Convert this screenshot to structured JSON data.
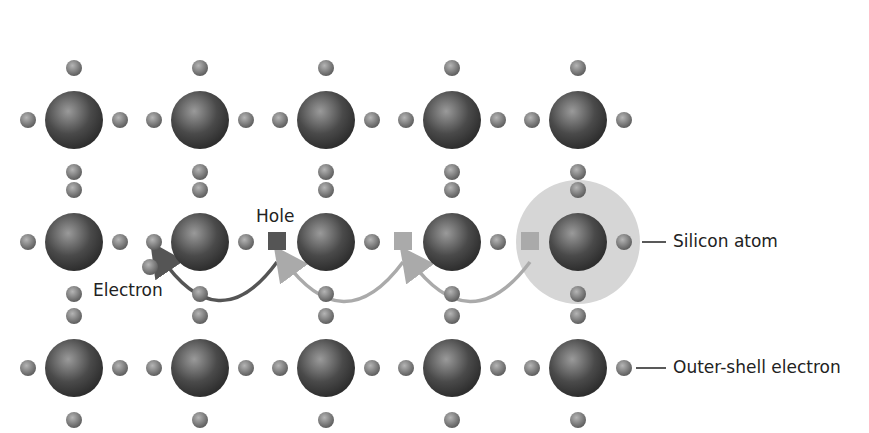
{
  "diagram": {
    "labels": {
      "hole": "Hole",
      "electron": "Electron",
      "silicon_atom": "Silicon atom",
      "outer_shell_electron": "Outer-shell electron"
    },
    "grid": {
      "columns_x": [
        74,
        200,
        326,
        452,
        578
      ],
      "rows_y": [
        120,
        242,
        368
      ],
      "atom_radius": 29,
      "electron_radius": 8,
      "electron_offset": 46,
      "vertical_electron_offset": 52
    },
    "holes": [
      {
        "x": 277,
        "y": 241,
        "color": "#555555"
      },
      {
        "x": 403,
        "y": 241,
        "color": "#aaaaaa"
      },
      {
        "x": 530,
        "y": 241,
        "color": "#aaaaaa"
      }
    ],
    "displaced_electron": {
      "x": 150,
      "y": 267
    },
    "highlight": {
      "cx": 578,
      "cy": 242,
      "r": 62,
      "color": "#d6d6d6"
    },
    "arrows": [
      {
        "from": [
          277,
          262
        ],
        "to": [
          160,
          256
        ],
        "color": "#555555"
      },
      {
        "from": [
          403,
          262
        ],
        "to": [
          284,
          260
        ],
        "color": "#aaaaaa"
      },
      {
        "from": [
          530,
          262
        ],
        "to": [
          410,
          260
        ],
        "color": "#aaaaaa"
      }
    ],
    "colors": {
      "atom_dark": "#3a3a3a",
      "atom_light": "#9a9a9a",
      "electron_dark": "#666666",
      "electron_light": "#b5b5b5",
      "text": "#222222"
    }
  }
}
